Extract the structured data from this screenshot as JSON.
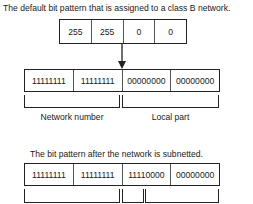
{
  "top_caption": "The default bit pattern that is assigned to a class B network.",
  "mask_decimal": [
    "255",
    "255",
    "0",
    "0"
  ],
  "default_bits": [
    "11111111",
    "11111111",
    "00000000",
    "00000000"
  ],
  "default_brackets": {
    "network_label": "Network number",
    "local_label": "Local part"
  },
  "bottom_caption": "The bit pattern after the network is subnetted.",
  "subnetted_bits": [
    "11111111",
    "11111111",
    "11110000",
    "00000000"
  ],
  "colors": {
    "line": "#222222",
    "text": "#1a1a1a",
    "background": "#ffffff"
  }
}
